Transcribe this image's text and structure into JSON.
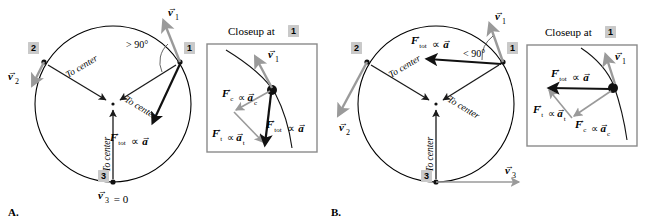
{
  "figure": {
    "panels": [
      {
        "letter": "A.",
        "id": "panel-a",
        "angle_label": "> 90°",
        "positions": [
          {
            "id": "1",
            "label": "1"
          },
          {
            "id": "2",
            "label": "2"
          },
          {
            "id": "3",
            "label": "3"
          }
        ],
        "to_center_labels": [
          "To center",
          "To center",
          "To center"
        ],
        "velocity_labels": {
          "v1": "v⃗1",
          "v2": "v⃗2",
          "v3": "v⃗3 = 0"
        },
        "main_force_label": "F⃗tot ∝ a⃗",
        "closeup": {
          "title": "Closeup at",
          "title_badge": "1",
          "labels": {
            "v1": "v⃗1",
            "fc": "F⃗c ∝ a⃗c",
            "ft": "F⃗t ∝ a⃗t",
            "ftot": "F⃗tot ∝ a⃗"
          }
        }
      },
      {
        "letter": "B.",
        "id": "panel-b",
        "angle_label": "< 90°",
        "positions": [
          {
            "id": "1",
            "label": "1"
          },
          {
            "id": "2",
            "label": "2"
          },
          {
            "id": "3",
            "label": "3"
          }
        ],
        "to_center_labels": [
          "To center",
          "To center",
          "To center"
        ],
        "velocity_labels": {
          "v1": "v⃗1",
          "v2": "v⃗2",
          "v3": "v⃗3"
        },
        "main_force_label": "F⃗tot ∝ a⃗",
        "closeup": {
          "title": "Closeup at",
          "title_badge": "1",
          "labels": {
            "v1": "v⃗1",
            "fc": "F⃗c ∝ a⃗c",
            "ft": "F⃗t ∝ a⃗t",
            "ftot": "F⃗tot ∝ a⃗"
          }
        }
      }
    ],
    "colors": {
      "velocity_gray": "#9a9a9a",
      "force_black": "#111111",
      "badge_gray": "#c9c9c9",
      "box_border": "#8a8a8a"
    }
  }
}
